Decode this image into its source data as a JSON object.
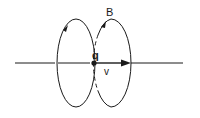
{
  "diagram": {
    "labels": {
      "charge": "q",
      "velocity": "v",
      "field": "B"
    },
    "colors": {
      "stroke": "#1a1a1a",
      "background": "#ffffff"
    },
    "elements": [
      {
        "type": "axis-line",
        "description": "horizontal line through charge"
      },
      {
        "type": "point-charge",
        "label": "q"
      },
      {
        "type": "velocity-vector",
        "label": "v",
        "direction": "right"
      },
      {
        "type": "field-loop",
        "label": "B",
        "position": "left",
        "direction": "counterclockwise-arrow"
      },
      {
        "type": "field-loop",
        "label": "B",
        "position": "right",
        "direction": "counterclockwise-arrow"
      }
    ]
  }
}
